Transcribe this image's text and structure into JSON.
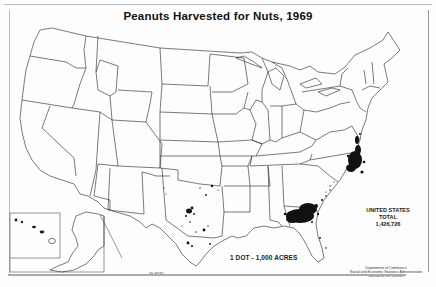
{
  "map": {
    "title": "Peanuts Harvested for Nuts, 1969",
    "total": {
      "line1": "UNITED STATES",
      "line2": "TOTAL",
      "value": "1,426,726"
    },
    "scale_note": "1 DOT - 1,000 ACRES",
    "source": {
      "line1": "Department of Commerce",
      "line2": "Social and Economic Statistics Administration",
      "line3": "Bureau of the Census"
    },
    "map_id": "69-M181",
    "insets": [
      "Alaska",
      "Hawaii"
    ],
    "dot_clusters": [
      {
        "region": "Virginia / North Carolina",
        "density": "very high"
      },
      {
        "region": "Southwest Georgia / Southeast Alabama / Florida panhandle",
        "density": "very high"
      },
      {
        "region": "Central Texas",
        "density": "medium"
      },
      {
        "region": "South Texas",
        "density": "low"
      },
      {
        "region": "Southern Oklahoma",
        "density": "low"
      },
      {
        "region": "South Carolina",
        "density": "low"
      },
      {
        "region": "New Mexico (east)",
        "density": "very low"
      }
    ],
    "colors": {
      "ink": "#111111",
      "paper": "#fdfdfd",
      "border": "#999999"
    }
  }
}
